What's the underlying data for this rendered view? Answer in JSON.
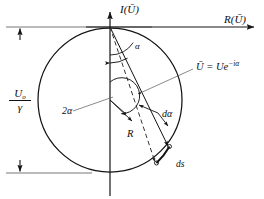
{
  "figure": {
    "axes": {
      "imaginary_label": "I(Ū)",
      "real_label": "R(Ū)"
    },
    "labels": {
      "amplitude_fraction_numerator": "U",
      "amplitude_fraction_numerator_sub": "o",
      "amplitude_fraction_denominator": "γ",
      "angle_alpha": "α",
      "angle_two_alpha": "2α",
      "radius": "R",
      "arc_angle_element": "dα",
      "arc_length_element": "ds",
      "vector_equation_lhs": "Ū",
      "vector_equation_eq": "=",
      "vector_equation_rhs_base": "Ue",
      "vector_equation_rhs_exp": "−iα"
    },
    "geometry": {
      "origin_x": 110,
      "origin_y": 27,
      "center_x": 110,
      "center_y": 100,
      "radius": 72
    },
    "colors": {
      "stroke": "#141414",
      "thin_stroke": "#4a4a4a",
      "background": "#ffffff"
    }
  }
}
